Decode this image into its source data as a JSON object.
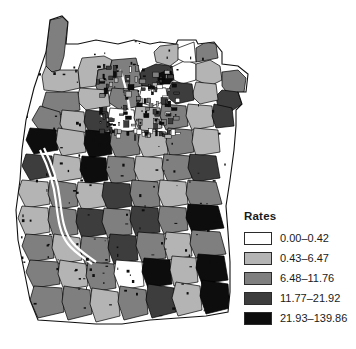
{
  "figure": {
    "width": 356,
    "height": 349,
    "background": "#ffffff",
    "type": "choropleth-map"
  },
  "legend": {
    "title": "Rates",
    "classes": [
      {
        "label": "0.00–0.42",
        "color": "#ffffff",
        "min": 0.0,
        "max": 0.42
      },
      {
        "label": "0.43–6.47",
        "color": "#b4b4b4",
        "min": 0.43,
        "max": 6.47
      },
      {
        "label": "6.48–11.76",
        "color": "#7f7f7f",
        "min": 6.48,
        "max": 11.76
      },
      {
        "label": "11.77–21.92",
        "color": "#3d3d3d",
        "min": 11.77,
        "max": 21.92
      },
      {
        "label": "21.93–139.86",
        "color": "#0d0d0d",
        "min": 21.93,
        "max": 139.86
      }
    ]
  },
  "chart_data": {
    "type": "map",
    "title": "Rates",
    "subtitle": "",
    "xlabel": "",
    "ylabel": "",
    "legend_position": "bottom-right",
    "grid": false,
    "classification": "quantile-5-class",
    "color_scheme": "grayscale-sequential",
    "outline_color": "#000000",
    "categories": [
      "0.00–0.42",
      "0.43–6.47",
      "6.48–11.76",
      "11.77–21.92",
      "21.93–139.86"
    ],
    "values": [
      0.42,
      6.47,
      11.76,
      21.92,
      139.86
    ],
    "class_colors": [
      "#ffffff",
      "#b4b4b4",
      "#7f7f7f",
      "#3d3d3d",
      "#0d0d0d"
    ],
    "regions": [
      {
        "id": "r01",
        "cls": 2,
        "pts": "46,52 50,20 60,18 64,16 68,22 66,38 64,56 60,70 52,72 46,66"
      },
      {
        "id": "r02",
        "cls": 1,
        "pts": "46,66 52,72 60,70 78,70 80,88 62,92 44,90 42,76"
      },
      {
        "id": "r03",
        "cls": 1,
        "pts": "80,88 96,86 98,70 110,68 112,60 104,56 82,58 78,70"
      },
      {
        "id": "r04",
        "cls": 2,
        "pts": "112,60 136,58 140,74 142,86 120,90 98,92 96,86 98,70 110,68"
      },
      {
        "id": "r05",
        "cls": 3,
        "pts": "142,70 156,64 172,66 174,80 158,86 142,86 140,74"
      },
      {
        "id": "r06",
        "cls": 4,
        "pts": "158,74 168,70 174,76 170,84 160,84"
      },
      {
        "id": "r07",
        "cls": 0,
        "pts": "170,68 186,60 196,64 196,80 182,84 174,80 172,66"
      },
      {
        "id": "r08",
        "cls": 1,
        "pts": "196,64 210,60 220,66 222,80 210,86 196,80"
      },
      {
        "id": "r09",
        "cls": 2,
        "pts": "196,48 206,42 216,44 218,58 208,60 196,62"
      },
      {
        "id": "r10",
        "cls": 0,
        "pts": "178,48 194,42 196,62 184,62 176,58"
      },
      {
        "id": "r11",
        "cls": 1,
        "pts": "160,46 178,44 178,60 170,66 156,62 154,52"
      },
      {
        "id": "r12",
        "cls": 2,
        "pts": "222,72 238,70 246,78 244,92 228,94 222,86"
      },
      {
        "id": "r13",
        "cls": 3,
        "pts": "222,90 238,92 242,104 230,112 218,108 216,96"
      },
      {
        "id": "r14",
        "cls": 1,
        "pts": "196,82 216,84 218,100 200,104 192,96"
      },
      {
        "id": "r15",
        "cls": 3,
        "pts": "172,82 192,84 194,100 176,104 166,96"
      },
      {
        "id": "r16",
        "cls": 0,
        "pts": "142,86 166,88 168,100 152,106 138,102"
      },
      {
        "id": "r17",
        "cls": 2,
        "pts": "112,88 138,90 140,106 120,110 108,102"
      },
      {
        "id": "r18",
        "cls": 1,
        "pts": "80,88 108,90 110,106 86,110 76,100"
      },
      {
        "id": "r19",
        "cls": 2,
        "pts": "46,92 78,92 80,110 56,116 42,106"
      },
      {
        "id": "r20",
        "cls": 2,
        "pts": "40,106 60,112 62,130 42,134 32,120"
      },
      {
        "id": "r21",
        "cls": 1,
        "pts": "62,110 84,112 86,132 66,136 60,124"
      },
      {
        "id": "r22",
        "cls": 3,
        "pts": "86,110 108,112 110,130 90,134 84,122"
      },
      {
        "id": "r23",
        "cls": 0,
        "pts": "110,108 134,110 136,130 114,134 108,120"
      },
      {
        "id": "r24",
        "cls": 1,
        "pts": "136,106 160,108 162,128 140,132 134,118"
      },
      {
        "id": "r25",
        "cls": 2,
        "pts": "162,104 186,106 188,126 166,130 160,116"
      },
      {
        "id": "r26",
        "cls": 1,
        "pts": "188,104 212,106 214,126 192,130 186,116"
      },
      {
        "id": "r27",
        "cls": 3,
        "pts": "214,104 232,108 234,126 216,128 212,116"
      },
      {
        "id": "r28",
        "cls": 4,
        "pts": "30,128 56,130 58,150 34,154 26,140"
      },
      {
        "id": "r29",
        "cls": 1,
        "pts": "58,128 84,132 86,152 62,156 56,142"
      },
      {
        "id": "r30",
        "cls": 4,
        "pts": "86,130 110,132 112,154 90,158 84,144"
      },
      {
        "id": "r31",
        "cls": 2,
        "pts": "112,130 138,132 140,154 116,158 110,144"
      },
      {
        "id": "r32",
        "cls": 1,
        "pts": "140,130 166,132 168,154 144,158 138,144"
      },
      {
        "id": "r33",
        "cls": 2,
        "pts": "168,128 192,130 194,152 170,156 166,142"
      },
      {
        "id": "r34",
        "cls": 1,
        "pts": "194,128 218,130 220,152 196,156 192,142"
      },
      {
        "id": "r35",
        "cls": 3,
        "pts": "26,154 52,156 54,176 30,180 22,166"
      },
      {
        "id": "r36",
        "cls": 1,
        "pts": "54,154 80,158 82,178 58,182 52,168"
      },
      {
        "id": "r37",
        "cls": 4,
        "pts": "82,156 106,158 108,180 86,184 80,170"
      },
      {
        "id": "r38",
        "cls": 2,
        "pts": "108,156 134,158 136,180 112,184 106,170"
      },
      {
        "id": "r39",
        "cls": 1,
        "pts": "136,156 162,158 164,180 140,184 134,170"
      },
      {
        "id": "r40",
        "cls": 2,
        "pts": "164,154 190,156 192,178 168,182 162,168"
      },
      {
        "id": "r41",
        "cls": 3,
        "pts": "190,154 216,156 220,178 194,182 188,168"
      },
      {
        "id": "r42",
        "cls": 1,
        "pts": "22,180 48,182 50,204 26,208 18,192"
      },
      {
        "id": "r43",
        "cls": 2,
        "pts": "50,180 76,184 78,206 54,210 48,194"
      },
      {
        "id": "r44",
        "cls": 1,
        "pts": "78,182 104,184 106,206 82,210 76,196"
      },
      {
        "id": "r45",
        "cls": 3,
        "pts": "104,182 130,184 132,206 108,210 102,196"
      },
      {
        "id": "r46",
        "cls": 2,
        "pts": "132,180 158,182 160,206 136,210 130,194"
      },
      {
        "id": "r47",
        "cls": 1,
        "pts": "160,180 186,182 188,204 164,208 158,194"
      },
      {
        "id": "r48",
        "cls": 2,
        "pts": "188,180 216,182 222,204 192,208 186,194"
      },
      {
        "id": "r49",
        "cls": 1,
        "pts": "22,206 48,208 50,232 26,236 18,218"
      },
      {
        "id": "r50",
        "cls": 2,
        "pts": "50,206 76,210 78,234 54,238 48,220"
      },
      {
        "id": "r51",
        "cls": 3,
        "pts": "78,208 104,210 106,234 82,238 76,222"
      },
      {
        "id": "r52",
        "cls": 2,
        "pts": "104,208 130,210 132,234 108,238 102,222"
      },
      {
        "id": "r53",
        "cls": 3,
        "pts": "132,206 158,208 160,232 136,236 130,220"
      },
      {
        "id": "r54",
        "cls": 2,
        "pts": "160,206 186,208 188,230 164,234 158,220"
      },
      {
        "id": "r55",
        "cls": 4,
        "pts": "188,204 218,206 224,228 192,232 186,218"
      },
      {
        "id": "r56",
        "cls": 2,
        "pts": "26,234 52,236 54,258 30,262 22,246"
      },
      {
        "id": "r57",
        "cls": 1,
        "pts": "54,234 80,238 82,260 58,264 52,248"
      },
      {
        "id": "r58",
        "cls": 2,
        "pts": "82,236 108,238 110,262 86,266 80,250"
      },
      {
        "id": "r59",
        "cls": 3,
        "pts": "110,234 136,236 138,260 114,264 108,248"
      },
      {
        "id": "r60",
        "cls": 2,
        "pts": "138,232 164,234 166,258 142,262 136,246"
      },
      {
        "id": "r61",
        "cls": 1,
        "pts": "166,232 190,234 192,256 168,260 164,246"
      },
      {
        "id": "r62",
        "cls": 2,
        "pts": "192,230 220,232 226,254 196,258 190,244"
      },
      {
        "id": "r63",
        "cls": 2,
        "pts": "30,260 58,262 60,284 34,288 26,272"
      },
      {
        "id": "r64",
        "cls": 1,
        "pts": "60,260 86,264 88,286 64,290 58,274"
      },
      {
        "id": "r65",
        "cls": 2,
        "pts": "88,262 114,264 116,288 92,292 86,276"
      },
      {
        "id": "r66",
        "cls": 0,
        "pts": "116,260 142,262 144,286 120,290 114,274"
      },
      {
        "id": "r67",
        "cls": 4,
        "pts": "144,258 170,260 172,284 148,288 142,272"
      },
      {
        "id": "r68",
        "cls": 1,
        "pts": "172,256 196,258 198,282 174,286 170,270"
      },
      {
        "id": "r69",
        "cls": 4,
        "pts": "198,254 224,256 228,280 202,284 196,268"
      },
      {
        "id": "r70",
        "cls": 2,
        "pts": "34,286 62,288 64,312 38,318 30,300"
      },
      {
        "id": "r71",
        "cls": 2,
        "pts": "64,286 90,290 92,314 68,320 62,302"
      },
      {
        "id": "r72",
        "cls": 1,
        "pts": "92,288 118,292 120,316 96,322 90,304"
      },
      {
        "id": "r73",
        "cls": 2,
        "pts": "120,286 146,290 148,314 124,320 118,302"
      },
      {
        "id": "r74",
        "cls": 3,
        "pts": "148,284 174,288 176,312 152,318 146,300"
      },
      {
        "id": "r75",
        "cls": 1,
        "pts": "176,282 200,286 202,310 178,316 172,298"
      },
      {
        "id": "r76",
        "cls": 4,
        "pts": "202,280 228,284 230,308 206,314 200,296"
      }
    ]
  }
}
